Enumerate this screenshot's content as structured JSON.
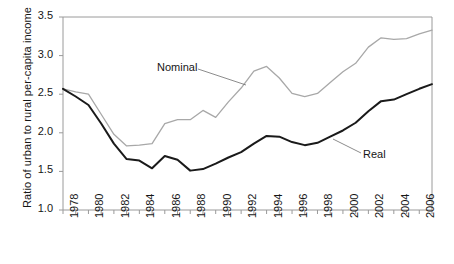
{
  "chart_data": {
    "type": "line",
    "title": "",
    "xlabel": "",
    "ylabel": "Ratio of urban to rural per-capita income",
    "xlim": [
      1978,
      2007
    ],
    "ylim": [
      1.0,
      3.5
    ],
    "yticks": [
      "1.0",
      "1.5",
      "2.0",
      "2.5",
      "3.0",
      "3.5"
    ],
    "ytick_values": [
      1.0,
      1.5,
      2.0,
      2.5,
      3.0,
      3.5
    ],
    "xticks": [
      "1978",
      "1980",
      "1982",
      "1984",
      "1986",
      "1988",
      "1990",
      "1992",
      "1994",
      "1996",
      "1998",
      "2000",
      "2002",
      "2004",
      "2006"
    ],
    "xtick_values": [
      1978,
      1980,
      1982,
      1984,
      1986,
      1988,
      1990,
      1992,
      1994,
      1996,
      1998,
      2000,
      2002,
      2004,
      2006
    ],
    "grid": false,
    "legend_position": "inline-annotations",
    "x": [
      1978,
      1979,
      1980,
      1981,
      1982,
      1983,
      1984,
      1985,
      1986,
      1987,
      1988,
      1989,
      1990,
      1991,
      1992,
      1993,
      1994,
      1995,
      1996,
      1997,
      1998,
      1999,
      2000,
      2001,
      2002,
      2003,
      2004,
      2005,
      2006,
      2007
    ],
    "series": [
      {
        "name": "Nominal",
        "color": "#a8a8a8",
        "values": [
          2.57,
          2.53,
          2.5,
          2.24,
          1.98,
          1.83,
          1.84,
          1.86,
          2.12,
          2.17,
          2.17,
          2.29,
          2.2,
          2.4,
          2.58,
          2.8,
          2.86,
          2.71,
          2.51,
          2.47,
          2.51,
          2.65,
          2.79,
          2.9,
          3.11,
          3.23,
          3.21,
          3.22,
          3.28,
          3.33
        ]
      },
      {
        "name": "Real",
        "color": "#1a1a1a",
        "values": [
          2.57,
          2.47,
          2.36,
          2.12,
          1.86,
          1.66,
          1.64,
          1.54,
          1.7,
          1.65,
          1.51,
          1.53,
          1.6,
          1.68,
          1.75,
          1.86,
          1.96,
          1.95,
          1.88,
          1.84,
          1.87,
          1.95,
          2.03,
          2.13,
          2.28,
          2.41,
          2.43,
          2.5,
          2.57,
          2.63
        ]
      }
    ],
    "annotations": [
      {
        "label": "Nominal",
        "x_px": 157,
        "y_px": 69,
        "leader_from_x_px": 198,
        "leader_from_y_px": 69,
        "leader_to_x_px": 246,
        "leader_to_y_px": 85
      },
      {
        "label": "Real",
        "x_px": 363,
        "y_px": 156,
        "leader_from_x_px": 361,
        "leader_from_y_px": 153,
        "leader_to_x_px": 333,
        "leader_to_y_px": 139
      }
    ]
  },
  "plot_frame": {
    "left": 63,
    "right": 432,
    "top": 17,
    "bottom": 210,
    "frame_color": "#9a9a9a",
    "tick_color": "#9a9a9a"
  }
}
